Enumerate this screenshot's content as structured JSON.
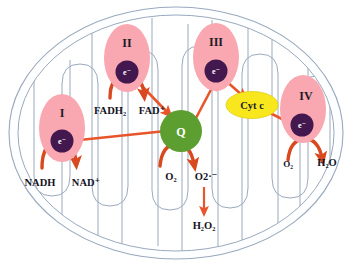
{
  "diagram": {
    "type": "biological-pathway-diagram",
    "organelle": "mitochondrion",
    "colors": {
      "background": "#ffffff",
      "membrane_stroke": "#9aa9bd",
      "membrane_fill": "#fdfeff",
      "complex_fill": "#f9a7b0",
      "complex_fill_light": "#fbbcc4",
      "electron_fill": "#43184f",
      "q_fill": "#5c9e30",
      "cytc_fill": "#f9e71e",
      "cytc_stroke": "#d8c516",
      "arrow": "#e8552a",
      "arrow_dark": "#d44a22",
      "text": "#14141e"
    },
    "complexes": [
      {
        "id": "complex-i",
        "label": "I",
        "carrier": "e⁻"
      },
      {
        "id": "complex-ii",
        "label": "II",
        "carrier": "e⁻"
      },
      {
        "id": "complex-iii",
        "label": "III",
        "carrier": "e⁻"
      },
      {
        "id": "complex-iv",
        "label": "IV",
        "carrier": "e⁻"
      }
    ],
    "carriers": [
      {
        "id": "ubiquinone",
        "label": "Q",
        "name": "ubiquinone"
      },
      {
        "id": "cytochrome-c",
        "label": "Cyt c",
        "name": "cytochrome c"
      }
    ],
    "molecules": {
      "nadh": {
        "text": "NADH",
        "base": "NADH",
        "sub": "",
        "sup": ""
      },
      "nad_plus": {
        "text": "NAD⁺",
        "base": "NAD",
        "sub": "",
        "sup": "+"
      },
      "fadh2": {
        "text": "FADH₂",
        "base": "FADH",
        "sub": "2",
        "sup": ""
      },
      "fad_plus": {
        "text": "FAD⁺",
        "base": "FAD",
        "sub": "",
        "sup": "+"
      },
      "o2_q": {
        "text": "O₂",
        "base": "O",
        "sub": "2",
        "sup": ""
      },
      "superoxide": {
        "text": "O2·⁻",
        "base": "O2",
        "sub": "",
        "sup": "·−"
      },
      "h2o2": {
        "text": "H₂O₂",
        "base": "H",
        "sub": "2",
        "sup": ""
      },
      "o2_civ": {
        "text": "O₂",
        "base": "O",
        "sub": "2",
        "sup": ""
      },
      "h2o": {
        "text": "H₂O",
        "base": "H",
        "sub": "2",
        "sup": ""
      }
    },
    "reactions": [
      {
        "id": "nadh-to-nad",
        "from": "NADH",
        "to": "NAD⁺",
        "at": "Complex I",
        "style": "curved"
      },
      {
        "id": "fadh2-to-fad",
        "from": "FADH₂",
        "to": "FAD⁺",
        "at": "Complex II",
        "style": "curved"
      },
      {
        "id": "ci-to-q",
        "from": "Complex I",
        "to": "Q",
        "style": "straight"
      },
      {
        "id": "cii-to-q",
        "from": "Complex II",
        "to": "Q",
        "style": "straight"
      },
      {
        "id": "q-to-ciii",
        "from": "Q",
        "to": "Complex III",
        "style": "straight"
      },
      {
        "id": "ciii-to-cytc",
        "from": "Complex III",
        "to": "Cyt c",
        "style": "straight"
      },
      {
        "id": "cytc-to-civ",
        "from": "Cyt c",
        "to": "Complex IV",
        "style": "straight"
      },
      {
        "id": "o2-to-superoxide",
        "from": "O₂",
        "to": "O2·⁻",
        "at": "Q",
        "style": "curved"
      },
      {
        "id": "superoxide-to-h2o2",
        "from": "O2·⁻",
        "to": "H₂O₂",
        "style": "straight-down"
      },
      {
        "id": "o2-to-h2o",
        "from": "O₂",
        "to": "H₂O",
        "at": "Complex IV",
        "style": "curved"
      }
    ]
  }
}
